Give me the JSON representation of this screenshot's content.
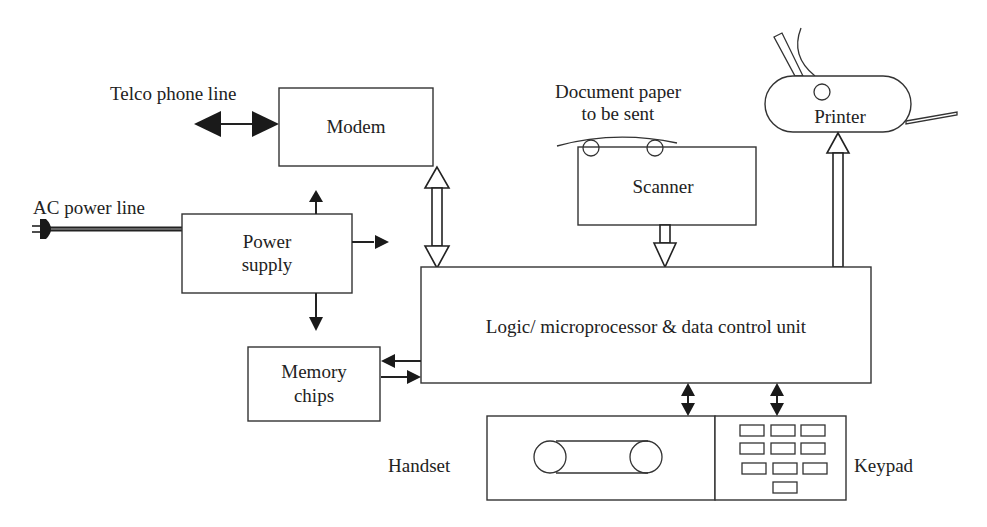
{
  "diagram": {
    "blocks": {
      "modem": {
        "label": "Modem"
      },
      "power_supply": {
        "label_line1": "Power",
        "label_line2": "supply"
      },
      "scanner": {
        "label": "Scanner"
      },
      "printer": {
        "label": "Printer"
      },
      "logic_unit": {
        "label": "Logic/ microprocessor & data control unit"
      },
      "memory": {
        "label_line1": "Memory",
        "label_line2": "chips"
      },
      "handset": {
        "label": "Handset"
      },
      "keypad": {
        "label": "Keypad"
      }
    },
    "external_labels": {
      "telco": "Telco phone line",
      "ac_power": "AC power line",
      "document_line1": "Document paper",
      "document_line2": "to be sent"
    },
    "connections": [
      {
        "from": "telco_line",
        "to": "modem",
        "type": "bidirectional-solid"
      },
      {
        "from": "modem",
        "to": "logic_unit",
        "type": "bidirectional-hollow"
      },
      {
        "from": "ac_power_line",
        "to": "power_supply",
        "type": "cable"
      },
      {
        "from": "power_supply",
        "to": "up",
        "type": "solid-arrow"
      },
      {
        "from": "power_supply",
        "to": "right",
        "type": "solid-arrow"
      },
      {
        "from": "power_supply",
        "to": "memory",
        "type": "solid-arrow"
      },
      {
        "from": "scanner",
        "to": "logic_unit",
        "type": "hollow-arrow"
      },
      {
        "from": "logic_unit",
        "to": "printer",
        "type": "hollow-arrow"
      },
      {
        "from": "logic_unit",
        "to": "memory",
        "type": "solid-arrow"
      },
      {
        "from": "memory",
        "to": "logic_unit",
        "type": "solid-arrow"
      },
      {
        "from": "logic_unit",
        "to": "handset",
        "type": "bidirectional-solid"
      },
      {
        "from": "logic_unit",
        "to": "keypad",
        "type": "bidirectional-solid"
      }
    ],
    "colors": {
      "stroke": "#222222",
      "background": "#ffffff"
    }
  }
}
